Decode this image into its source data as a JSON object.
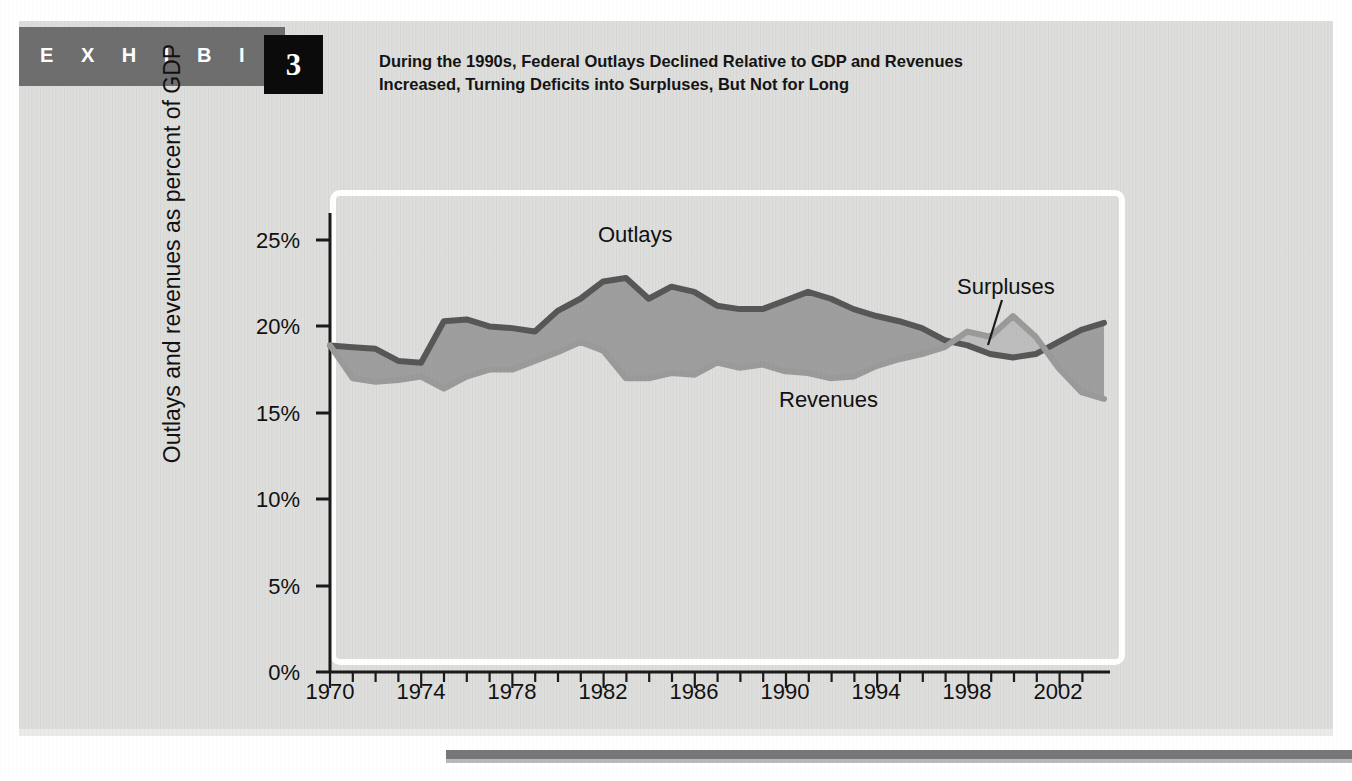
{
  "header": {
    "exhibit_word": "E X H I B I T",
    "exhibit_number": "3",
    "title_line1": "During the 1990s, Federal Outlays Declined Relative to GDP and Revenues",
    "title_line2": "Increased, Turning Deficits into Surpluses, But Not for Long",
    "bar_color": "#6e6e6e",
    "number_box_color": "#0b0b0b",
    "panel_color": "#dededc"
  },
  "chart_data": {
    "type": "area",
    "title": "During the 1990s, Federal Outlays Declined Relative to GDP and Revenues Increased, Turning Deficits into Surpluses, But Not for Long",
    "xlabel": "",
    "ylabel": "Outlays and revenues as percent of GDP",
    "xlim": [
      1970,
      2004
    ],
    "ylim": [
      0,
      26
    ],
    "grid": false,
    "legend_position": "inline-annotations",
    "ytick_labels": [
      "0%",
      "5%",
      "10%",
      "15%",
      "20%",
      "25%"
    ],
    "ytick_values": [
      0,
      5,
      10,
      15,
      20,
      25
    ],
    "xtick_labels": [
      "1970",
      "1974",
      "1978",
      "1982",
      "1986",
      "1990",
      "1994",
      "1998",
      "2002"
    ],
    "xtick_values": [
      1970,
      1974,
      1978,
      1982,
      1986,
      1990,
      1994,
      1998,
      2002
    ],
    "x": [
      1970,
      1971,
      1972,
      1973,
      1974,
      1975,
      1976,
      1977,
      1978,
      1979,
      1980,
      1981,
      1982,
      1983,
      1984,
      1985,
      1986,
      1987,
      1988,
      1989,
      1990,
      1991,
      1992,
      1993,
      1994,
      1995,
      1996,
      1997,
      1998,
      1999,
      2000,
      2001,
      2002,
      2003,
      2004
    ],
    "series": [
      {
        "name": "Outlays",
        "color": "#575757",
        "values": [
          18.9,
          18.8,
          18.7,
          18.0,
          17.9,
          20.3,
          20.4,
          20.0,
          19.9,
          19.7,
          20.9,
          21.6,
          22.6,
          22.8,
          21.6,
          22.3,
          22.0,
          21.2,
          21.0,
          21.0,
          21.5,
          22.0,
          21.6,
          21.0,
          20.6,
          20.3,
          19.9,
          19.2,
          18.9,
          18.4,
          18.2,
          18.4,
          19.1,
          19.8,
          20.2
        ]
      },
      {
        "name": "Revenues",
        "color": "#9a9a9a",
        "values": [
          18.9,
          17.0,
          16.8,
          16.9,
          17.1,
          16.4,
          17.1,
          17.5,
          17.5,
          18.0,
          18.5,
          19.1,
          18.6,
          17.0,
          17.0,
          17.3,
          17.2,
          17.9,
          17.6,
          17.8,
          17.4,
          17.3,
          17.0,
          17.1,
          17.7,
          18.1,
          18.4,
          18.8,
          19.7,
          19.4,
          20.6,
          19.4,
          17.6,
          16.2,
          15.8
        ]
      }
    ],
    "regions": [
      {
        "name": "Deficits",
        "label": "Deficits",
        "fill": "#9e9e9e",
        "description": "area where outlays exceed revenues"
      },
      {
        "name": "Surpluses",
        "label": "Surpluses",
        "fill": "#bdbdbd",
        "description": "area where revenues exceed outlays, 1998-2001"
      }
    ],
    "annotations": [
      {
        "text": "Outlays",
        "x_px": 598,
        "y_px": 239
      },
      {
        "text": "Deficits",
        "x_px": 655,
        "y_px": 321
      },
      {
        "text": "Revenues",
        "x_px": 779,
        "y_px": 403
      },
      {
        "text": "Surpluses",
        "x_px": 957,
        "y_px": 290,
        "leader_line": true
      }
    ]
  }
}
